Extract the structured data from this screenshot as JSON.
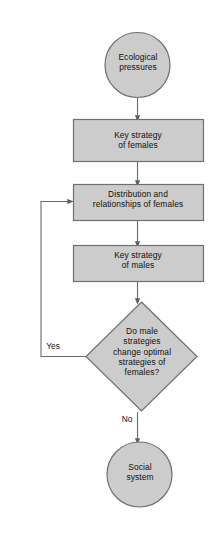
{
  "diagram": {
    "style": {
      "node_fill": "#cccccc",
      "node_stroke": "#6f6f6f",
      "edge_stroke": "#6b6b6b",
      "text_color": "#111111",
      "background": "#ffffff"
    },
    "nodes": [
      {
        "id": "ecological-pressures",
        "shape": "circle",
        "label": "Ecological\npressures"
      },
      {
        "id": "key-strategy-females",
        "shape": "rectangle",
        "label": "Key strategy\nof females"
      },
      {
        "id": "distribution-relationships-females",
        "shape": "rectangle",
        "label": "Distribution and\nrelationships of females"
      },
      {
        "id": "key-strategy-males",
        "shape": "rectangle",
        "label": "Key strategy\nof males"
      },
      {
        "id": "decision",
        "shape": "diamond",
        "label": "Do male\nstrategies\nchange optimal\nstrategies of\nfemales?"
      },
      {
        "id": "social-system",
        "shape": "circle",
        "label": "Social\nsystem"
      }
    ],
    "edges": [
      {
        "id": "edge-pressures-to-female-strategy",
        "from": "ecological-pressures",
        "to": "key-strategy-females",
        "label": ""
      },
      {
        "id": "edge-female-strategy-to-distribution",
        "from": "key-strategy-females",
        "to": "distribution-relationships-females",
        "label": ""
      },
      {
        "id": "edge-distribution-to-male-strategy",
        "from": "distribution-relationships-females",
        "to": "key-strategy-males",
        "label": ""
      },
      {
        "id": "edge-male-strategy-to-decision",
        "from": "key-strategy-males",
        "to": "decision",
        "label": ""
      },
      {
        "id": "edge-decision-yes-feedback",
        "from": "decision",
        "to": "distribution-relationships-females",
        "label": "Yes"
      },
      {
        "id": "edge-decision-no-to-social-system",
        "from": "decision",
        "to": "social-system",
        "label": "No"
      }
    ]
  }
}
